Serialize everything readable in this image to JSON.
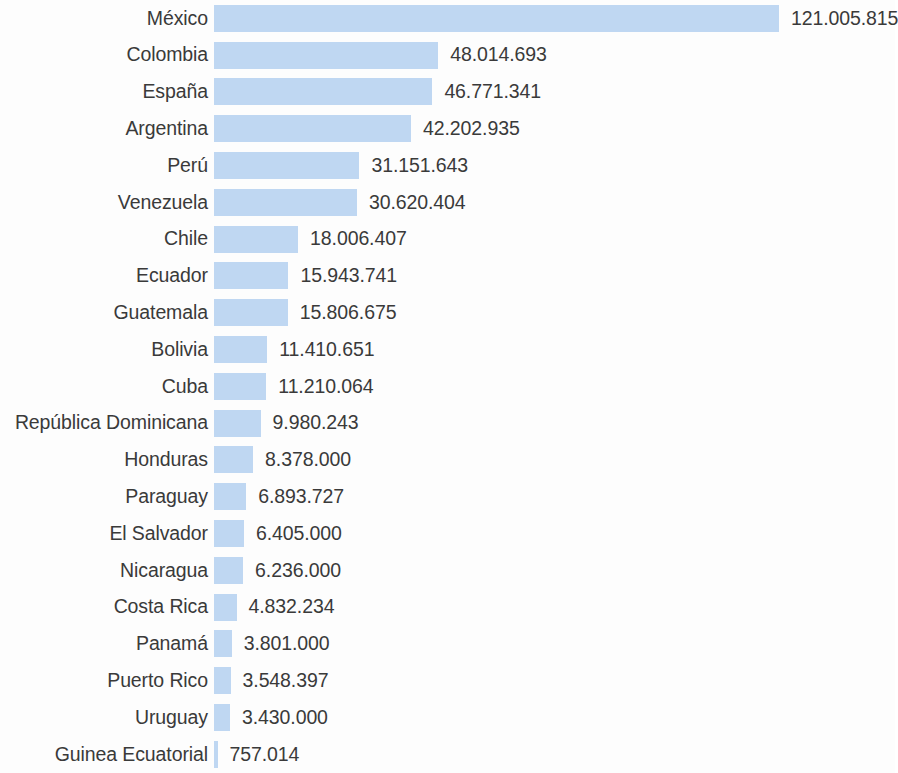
{
  "chart_data": {
    "type": "bar",
    "orientation": "horizontal",
    "title": "",
    "subtitle": "",
    "xlabel": "",
    "ylabel": "",
    "grid": false,
    "legend": null,
    "axis_visible": false,
    "value_labels_shown": true,
    "bar_color": "#bfd7f2",
    "text_color": "#3a3a3a",
    "background_color": "#fdfdfd",
    "xlim": [
      0,
      121005815
    ],
    "categories": [
      "México",
      "Colombia",
      "España",
      "Argentina",
      "Perú",
      "Venezuela",
      "Chile",
      "Ecuador",
      "Guatemala",
      "Bolivia",
      "Cuba",
      "República Dominicana",
      "Honduras",
      "Paraguay",
      "El Salvador",
      "Nicaragua",
      "Costa Rica",
      "Panamá",
      "Puerto Rico",
      "Uruguay",
      "Guinea Ecuatorial"
    ],
    "values": [
      121005815,
      48014693,
      46771341,
      42202935,
      31151643,
      30620404,
      18006407,
      15943741,
      15806675,
      11410651,
      11210064,
      9980243,
      8378000,
      6893727,
      6405000,
      6236000,
      4832234,
      3801000,
      3548397,
      3430000,
      757014
    ],
    "value_labels": [
      "121.005.815",
      "48.014.693",
      "46.771.341",
      "42.202.935",
      "31.151.643",
      "30.620.404",
      "18.006.407",
      "15.943.741",
      "15.806.675",
      "11.410.651",
      "11.210.064",
      "9.980.243",
      "8.378.000",
      "6.893.727",
      "6.405.000",
      "6.236.000",
      "4.832.234",
      "3.801.000",
      "3.548.397",
      "3.430.000",
      "757.014"
    ]
  }
}
